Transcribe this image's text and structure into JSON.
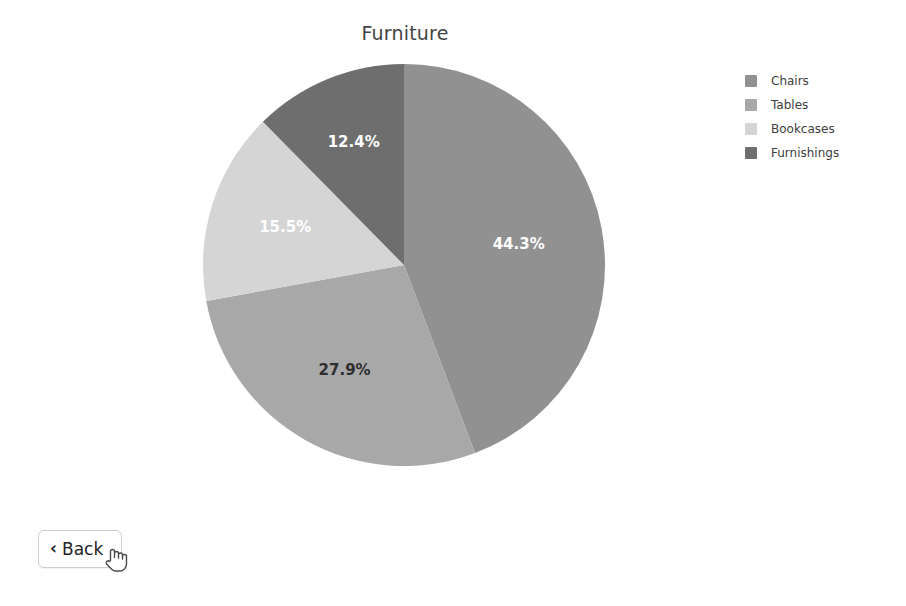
{
  "page": {
    "background_color": "#ffffff",
    "width": 906,
    "height": 606
  },
  "chart_data": {
    "type": "pie",
    "title": "Furniture",
    "categories": [
      "Chairs",
      "Tables",
      "Bookcases",
      "Furnishings"
    ],
    "values": [
      44.3,
      27.9,
      15.5,
      12.4
    ],
    "value_labels": [
      "44.3%",
      "27.9%",
      "15.5%",
      "12.4%"
    ],
    "colors": [
      "#919191",
      "#a8a8a8",
      "#d5d5d5",
      "#6e6e6e"
    ],
    "label_text_colors": [
      "#ffffff",
      "#2e2e2e",
      "#ffffff",
      "#ffffff"
    ],
    "units": "percent",
    "total": 100.1,
    "start_angle_deg": 0,
    "direction": "clockwise",
    "legend_position": "right",
    "grid": false,
    "xlabel": "",
    "ylabel": "",
    "slices": [
      {
        "name": "Chairs",
        "value": 44.3,
        "label": "44.3%",
        "color": "#919191",
        "label_color": "#ffffff",
        "label_radius_frac": 0.58
      },
      {
        "name": "Tables",
        "value": 27.9,
        "label": "27.9%",
        "color": "#a8a8a8",
        "label_color": "#2e2e2e",
        "label_radius_frac": 0.6
      },
      {
        "name": "Bookcases",
        "value": 15.5,
        "label": "15.5%",
        "color": "#d5d5d5",
        "label_color": "#ffffff",
        "label_radius_frac": 0.62
      },
      {
        "name": "Furnishings",
        "value": 12.4,
        "label": "12.4%",
        "color": "#6e6e6e",
        "label_color": "#ffffff",
        "label_radius_frac": 0.66
      }
    ]
  },
  "legend": {
    "items": [
      {
        "label": "Chairs",
        "color": "#919191"
      },
      {
        "label": "Tables",
        "color": "#a8a8a8"
      },
      {
        "label": "Bookcases",
        "color": "#d5d5d5"
      },
      {
        "label": "Furnishings",
        "color": "#6e6e6e"
      }
    ]
  },
  "back_button": {
    "label": "Back",
    "chevron": "‹",
    "icon_name": "chevron-left-icon"
  },
  "cursor": {
    "icon_name": "pointer-hand-cursor",
    "x": 104,
    "y": 544
  }
}
